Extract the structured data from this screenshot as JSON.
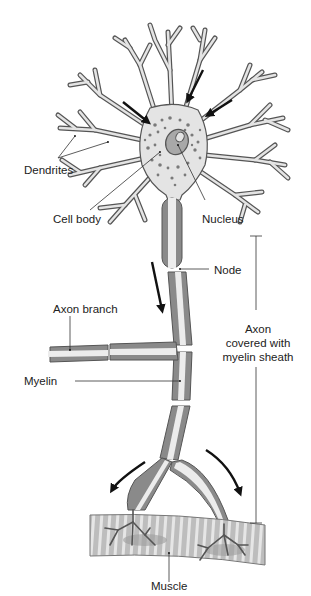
{
  "diagram": {
    "type": "biological-illustration",
    "colors": {
      "outline": "#555555",
      "cell_fill": "#e4e4e4",
      "myelin_dark": "#8a8a8a",
      "myelin_light": "#ececec",
      "dots": "#7a7a7a",
      "muscle_fill": "#bdbdbd",
      "muscle_stripe": "#e8e8e8",
      "arrow": "#111111",
      "leader": "#333333"
    },
    "labels": {
      "dendrites": "Dendrites",
      "cell_body": "Cell body",
      "nucleus": "Nucleus",
      "node": "Node",
      "axon_branch": "Axon branch",
      "myelin": "Myelin",
      "axon_line1": "Axon",
      "axon_line2": "covered with",
      "axon_line3": "myelin sheath",
      "muscle": "Muscle"
    },
    "flow_arrows": [
      "dendrite-to-soma upper-left",
      "dendrite-to-soma upper-right",
      "dendrite-to-soma right",
      "soma-to-axon downward",
      "axon-terminal left",
      "axon-terminal right"
    ]
  }
}
